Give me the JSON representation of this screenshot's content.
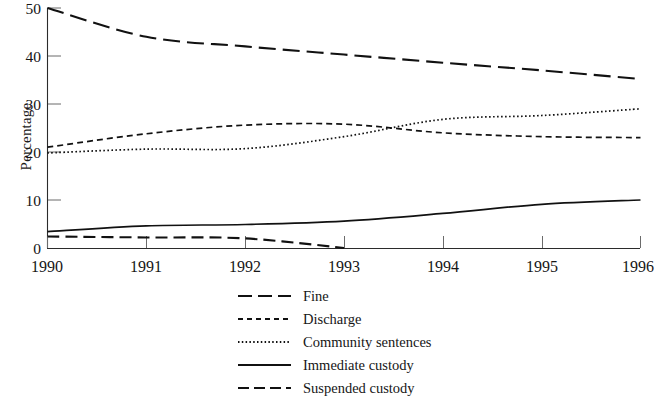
{
  "chart_data": {
    "type": "line",
    "title": "",
    "xlabel": "",
    "ylabel": "Percentage",
    "x": [
      1990,
      1991,
      1992,
      1993,
      1994,
      1995,
      1996
    ],
    "xtick_labels": [
      "1990",
      "1991",
      "1992",
      "1993",
      "1994",
      "1995",
      "1996"
    ],
    "ytick_labels": [
      "0",
      "10",
      "20",
      "30",
      "40",
      "50"
    ],
    "yticks": [
      0,
      10,
      20,
      30,
      40,
      50
    ],
    "ylim": [
      0,
      50
    ],
    "xlim": [
      1990,
      1996
    ],
    "grid": false,
    "legend_position": "below-center",
    "series": [
      {
        "name": "Fine",
        "dash": "long-dash",
        "values": [
          50.0,
          44.0,
          42.0,
          40.3,
          38.6,
          37.0,
          35.2
        ]
      },
      {
        "name": "Discharge",
        "dash": "short-dash",
        "values": [
          21.0,
          23.8,
          25.6,
          25.8,
          24.0,
          23.2,
          23.0
        ]
      },
      {
        "name": "Community sentences",
        "dash": "dotted",
        "values": [
          19.8,
          20.6,
          20.7,
          23.2,
          26.8,
          27.6,
          29.0
        ]
      },
      {
        "name": "Immediate custody",
        "dash": "solid",
        "values": [
          3.4,
          4.6,
          4.9,
          5.6,
          7.2,
          9.1,
          10.0
        ]
      },
      {
        "name": "Suspended custody",
        "dash": "medium-dash",
        "values": [
          2.4,
          2.2,
          2.0,
          0.0,
          null,
          null,
          null
        ]
      }
    ]
  },
  "legend": {
    "items": [
      {
        "label": "Fine",
        "swatch": "long-dash-swatch"
      },
      {
        "label": "Discharge",
        "swatch": "short-dash-swatch"
      },
      {
        "label": "Community sentences",
        "swatch": "dotted-swatch"
      },
      {
        "label": "Immediate custody",
        "swatch": "solid-swatch"
      },
      {
        "label": "Suspended custody",
        "swatch": "medium-dash-swatch"
      }
    ]
  }
}
